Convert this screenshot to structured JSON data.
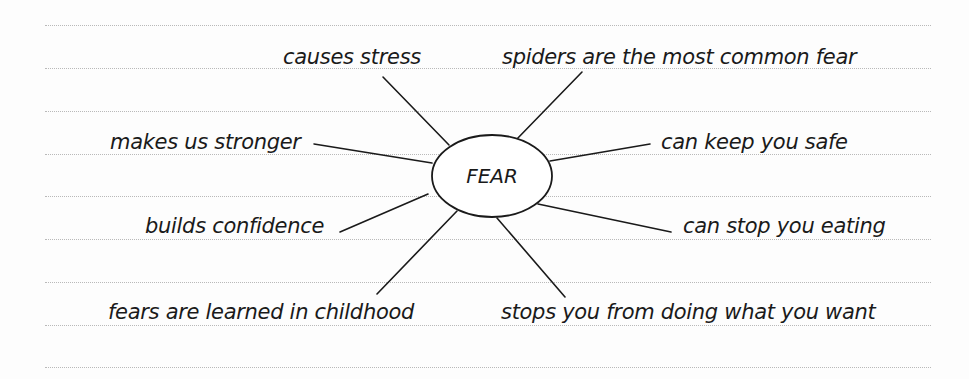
{
  "diagram": {
    "type": "mind-map",
    "center": {
      "label": "FEAR",
      "cx": 492,
      "cy": 176,
      "rx": 60,
      "ry": 41
    },
    "ruled_lines_y": [
      25,
      68,
      111,
      154,
      196,
      239,
      282,
      325,
      367
    ],
    "branches": [
      {
        "id": "causes-stress",
        "label": "causes stress",
        "text_x": 283,
        "text_top": 47,
        "line": [
          383,
          77,
          449,
          145
        ]
      },
      {
        "id": "spiders-common-fear",
        "label": "spiders are the most common fear",
        "text_x": 502,
        "text_top": 47,
        "line": [
          582,
          72,
          516,
          140
        ]
      },
      {
        "id": "makes-us-stronger",
        "label": "makes us stronger",
        "text_x": 110,
        "text_top": 132,
        "line": [
          314,
          144,
          432,
          163
        ]
      },
      {
        "id": "can-keep-you-safe",
        "label": "can keep you safe",
        "text_x": 661,
        "text_top": 132,
        "line": [
          650,
          144,
          550,
          161
        ]
      },
      {
        "id": "builds-confidence",
        "label": "builds confidence",
        "text_x": 145,
        "text_top": 216,
        "line": [
          340,
          232,
          428,
          194
        ]
      },
      {
        "id": "can-stop-you-eating",
        "label": "can stop you eating",
        "text_x": 683,
        "text_top": 216,
        "line": [
          671,
          232,
          538,
          204
        ]
      },
      {
        "id": "fears-learned-childhood",
        "label": "fears are learned in childhood",
        "text_x": 108,
        "text_top": 302,
        "line": [
          377,
          294,
          457,
          211
        ]
      },
      {
        "id": "stops-you-doing-what-you-want",
        "label": "stops you from doing what you want",
        "text_x": 501,
        "text_top": 302,
        "line": [
          565,
          297,
          497,
          218
        ]
      }
    ],
    "colors": {
      "ink": "#1a1a1a",
      "rule": "#b9b9b9",
      "paper": "#fdfdfd"
    }
  }
}
